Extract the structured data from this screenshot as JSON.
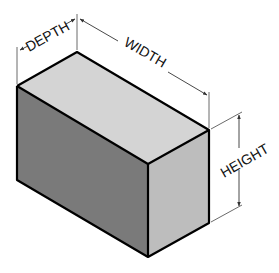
{
  "diagram": {
    "type": "isometric-box-dimensions",
    "labels": {
      "depth": "DEPTH",
      "width": "WIDTH",
      "height": "HEIGHT"
    },
    "colors": {
      "background": "#ffffff",
      "top_face": "#d4d4d4",
      "left_face": "#7a7a7a",
      "right_face": "#bdbdbd",
      "edge": "#000000",
      "dimension_line": "#333333"
    }
  }
}
